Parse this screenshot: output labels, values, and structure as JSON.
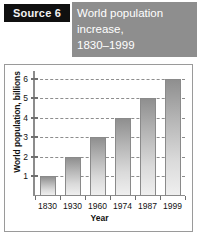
{
  "header": {
    "source_tag": "Source 6",
    "title_lines": [
      "World population",
      "increase,",
      "1830–1999"
    ],
    "tag_bg": "#101010",
    "title_bg": "#8e8e8e"
  },
  "chart_data": {
    "type": "bar",
    "title": "World population increase, 1830–1999",
    "categories": [
      "1830",
      "1930",
      "1960",
      "1974",
      "1987",
      "1999"
    ],
    "values": [
      1,
      2,
      3,
      4,
      5,
      6
    ],
    "xlabel": "Year",
    "ylabel": "World population, billions",
    "ylim": [
      0,
      6.4
    ],
    "yticks": [
      1,
      2,
      3,
      4,
      5,
      6
    ],
    "ytick_labels": [
      "1",
      "2",
      "3",
      "4",
      "5",
      "6"
    ],
    "grid": true,
    "grid_style": "dashed",
    "legend": false,
    "bar_color": "#b6b6b6",
    "bar_border_color": "#8a8a8a",
    "axis_color": "#8c8c8c",
    "units": "billions"
  }
}
